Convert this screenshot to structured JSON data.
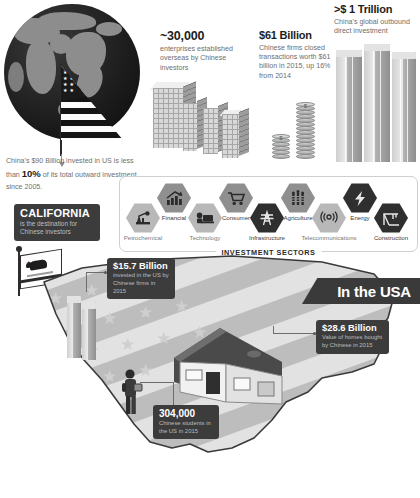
{
  "meta": {
    "accent_dark": "#3c3c3c",
    "accent_text_muted": "#6f6f6f"
  },
  "globe": {
    "name": "world-globe-with-us-flag",
    "caption_pre": "China's $90 Billion invested in US is less than ",
    "caption_strong": "10%",
    "caption_post": " of its total outward investment since 2005."
  },
  "stats": [
    {
      "id": "enterprises",
      "big": "~30,000",
      "sub": "enterprises established overseas by Chinese investors"
    },
    {
      "id": "transactions",
      "big": "$61 Billion",
      "sub": "Chinese firms closed transactions worth $61 billion in 2015, up 16% from 2014"
    },
    {
      "id": "global-odi",
      "big": ">$ 1 Trillion",
      "sub": "China's global outbound direct investment"
    }
  ],
  "sectors": {
    "legend": "INVESTMENT SECTORS",
    "items": [
      {
        "label": "Petrochemical",
        "icon": "oil-pump-icon",
        "tone": "light"
      },
      {
        "label": "Financial",
        "icon": "bar-chart-arrow-icon",
        "tone": "mid"
      },
      {
        "label": "Technology",
        "icon": "computer-icon",
        "tone": "light"
      },
      {
        "label": "Consumer",
        "icon": "shopping-cart-icon",
        "tone": "mid"
      },
      {
        "label": "Infrastructure",
        "icon": "power-pylon-icon",
        "tone": "dark"
      },
      {
        "label": "Agriculture",
        "icon": "wheat-icon",
        "tone": "mid"
      },
      {
        "label": "Telecommunications",
        "icon": "antenna-icon",
        "tone": "light"
      },
      {
        "label": "Energy",
        "icon": "lightning-bolt-icon",
        "tone": "dark"
      },
      {
        "label": "Construction",
        "icon": "crane-icon",
        "tone": "dark"
      }
    ]
  },
  "california": {
    "title": "CALIFORNIA",
    "sub": "is the destination for Chinese investors",
    "flag_icon": "california-bear-flag-icon"
  },
  "usa": {
    "ribbon": "In the USA",
    "map_icon": "united-states-map-icon",
    "house_icon": "house-icon",
    "person_icon": "student-person-icon",
    "callouts": [
      {
        "id": "fdi-2015",
        "big": "$15.7 Billion",
        "sub": "invested in the US by Chinese firms in 2015"
      },
      {
        "id": "homes",
        "big": "$28.6 Billion",
        "sub": "Value of homes bought by Chinese in 2015"
      },
      {
        "id": "students",
        "big": "304,000",
        "sub": "Chinese students in the US in 2015"
      }
    ]
  }
}
